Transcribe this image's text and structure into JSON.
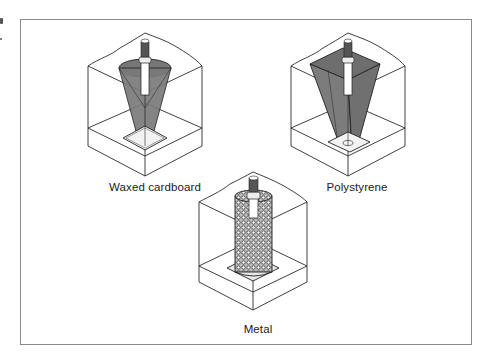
{
  "figure": {
    "panels": [
      {
        "id": "waxed-cardboard",
        "label": "Waxed cardboard",
        "sleeve_shape": "cone"
      },
      {
        "id": "polystyrene",
        "label": "Polystyrene",
        "sleeve_shape": "tapered-square"
      },
      {
        "id": "metal",
        "label": "Metal",
        "sleeve_shape": "mesh-cylinder"
      }
    ]
  },
  "colors": {
    "frame_border": "#8a8a8a",
    "line": "#2a2a2a",
    "sleeve_fill": "#7a7a7a",
    "background": "#ffffff"
  }
}
